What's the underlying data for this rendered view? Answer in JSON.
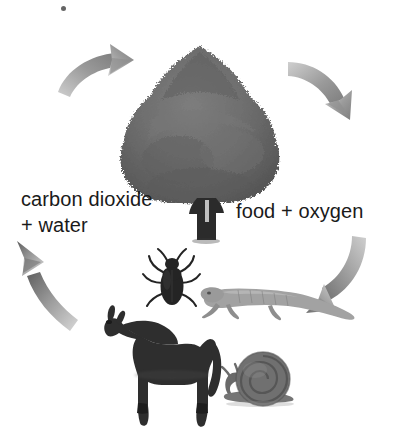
{
  "diagram": {
    "background_color": "#ffffff",
    "text_color": "#1a1a1a"
  },
  "labels": {
    "left": "carbon dioxide\n+ water",
    "right": "food + oxygen"
  },
  "figures": {
    "tree": {
      "name": "tree",
      "canopy_color": "#6f6f6f",
      "trunk_color": "#2b2b2b"
    },
    "horse": {
      "name": "horse",
      "color": "#2e2e2e"
    },
    "beetle": {
      "name": "beetle",
      "color": "#262626"
    },
    "lizard": {
      "name": "lizard",
      "color": "#9a9a9a"
    },
    "snail": {
      "name": "snail",
      "color": "#6b6b6b"
    }
  },
  "arrows": {
    "color": "#8a8a8a",
    "items": [
      {
        "name": "arrow-top-left",
        "direction": "up-right",
        "meaning": "carbon dioxide + water to tree"
      },
      {
        "name": "arrow-top-right",
        "direction": "down-right",
        "meaning": "tree to food + oxygen"
      },
      {
        "name": "arrow-bottom-right",
        "direction": "down-left",
        "meaning": "food + oxygen to animals"
      },
      {
        "name": "arrow-bottom-left",
        "direction": "up-left",
        "meaning": "animals to carbon dioxide + water"
      }
    ]
  }
}
